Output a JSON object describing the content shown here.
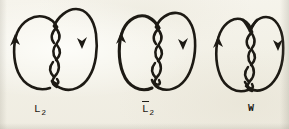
{
  "figure": {
    "background_color": "#f2f0e6",
    "ink_color": "#1d1a14",
    "width": 289,
    "height": 129,
    "panels": [
      {
        "id": "panel-L2",
        "label_text": "L",
        "label_subscript": "2",
        "label_overbar": false,
        "label_full": "L2",
        "label_x": 40,
        "label_y": 103,
        "description": "Two-lobed closed curve with a four-crossing vertical twist at center; right lobe passes over at top, left lobe over at bottom",
        "crossings": 4,
        "arrows": [
          {
            "name": "left-arrowhead",
            "direction": "up",
            "x": 16,
            "y": 42
          },
          {
            "name": "right-arrowhead",
            "direction": "down",
            "x": 81,
            "y": 40
          }
        ],
        "top_shape": "asymmetric, right lobe rises higher"
      },
      {
        "id": "panel-L2bar",
        "label_text": "L",
        "label_subscript": "2",
        "label_overbar": true,
        "label_full": "L̄2",
        "label_x": 148,
        "label_y": 103,
        "description": "Mirror image of L2: two-lobed closed curve with a four-crossing vertical twist at center, opposite handedness",
        "crossings": 4,
        "arrows": [
          {
            "name": "left-arrowhead",
            "direction": "up",
            "x": 122,
            "y": 40
          },
          {
            "name": "right-arrowhead",
            "direction": "down",
            "x": 182,
            "y": 41
          }
        ],
        "top_shape": "symmetric twin lobes"
      },
      {
        "id": "panel-W",
        "label_text": "W",
        "label_subscript": "",
        "label_overbar": false,
        "label_full": "W",
        "label_x": 251,
        "label_y": 103,
        "description": "Writhe diagram: two-lobed closed curve with a notched top and a four-crossing vertical twist at center",
        "crossings": 4,
        "arrows": [
          {
            "name": "left-arrowhead",
            "direction": "up",
            "x": 217,
            "y": 44
          },
          {
            "name": "right-arrowhead",
            "direction": "down",
            "x": 276,
            "y": 42
          }
        ],
        "top_shape": "notched / W-shaped dip at top center"
      }
    ]
  }
}
